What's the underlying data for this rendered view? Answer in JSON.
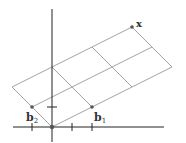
{
  "figure": {
    "type": "lattice-basis-diagram",
    "origin": [
      52,
      127
    ],
    "basis": {
      "b1": {
        "label": "b",
        "subscript": "1",
        "point": [
          92,
          107
        ]
      },
      "b2": {
        "label": "b",
        "subscript": "2",
        "point": [
          32,
          107
        ]
      }
    },
    "target": {
      "label": "x",
      "point": [
        132,
        27
      ]
    },
    "grid": {
      "steps_b1": 3,
      "steps_b2": 2
    },
    "axes": {
      "x_axis": {
        "from": [
          13,
          127
        ],
        "to": [
          164,
          127
        ]
      },
      "y_axis": {
        "from": [
          52,
          9
        ],
        "to": [
          52,
          142
        ]
      },
      "x_ticks": [
        32,
        72,
        92
      ],
      "y_ticks": [
        107
      ]
    },
    "colors": {
      "axis": "#222222",
      "grid": "#8a8a8a",
      "point": "#555555",
      "label": "#333333"
    }
  }
}
